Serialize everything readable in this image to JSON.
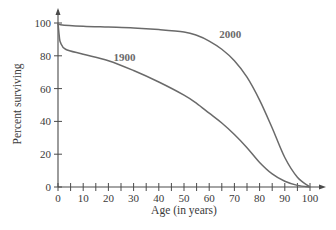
{
  "chart_data": {
    "type": "line",
    "title": "",
    "xlabel": "Age (in years)",
    "ylabel": "Percent surviving",
    "xlim": [
      0,
      100
    ],
    "ylim": [
      0,
      100
    ],
    "x_ticks": [
      0,
      10,
      20,
      30,
      40,
      50,
      60,
      70,
      80,
      90,
      100
    ],
    "x_minor_ticks_step": 5,
    "y_ticks": [
      0,
      20,
      40,
      60,
      80,
      100
    ],
    "grid": false,
    "legend": "inline labels on curves",
    "series": [
      {
        "name": "1900",
        "color": "#6a6a6a",
        "label_position": {
          "x": 22,
          "y": 77
        },
        "points": [
          [
            0,
            100
          ],
          [
            0.5,
            92
          ],
          [
            1,
            88
          ],
          [
            3,
            84
          ],
          [
            10,
            81
          ],
          [
            20,
            77
          ],
          [
            30,
            71
          ],
          [
            40,
            64
          ],
          [
            50,
            56
          ],
          [
            55,
            51
          ],
          [
            60,
            45
          ],
          [
            65,
            39
          ],
          [
            70,
            32
          ],
          [
            75,
            24
          ],
          [
            80,
            15
          ],
          [
            85,
            8
          ],
          [
            90,
            3.5
          ],
          [
            95,
            1
          ],
          [
            100,
            0
          ]
        ]
      },
      {
        "name": "2000",
        "color": "#6a6a6a",
        "label_position": {
          "x": 64,
          "y": 91
        },
        "points": [
          [
            0,
            100
          ],
          [
            1,
            99
          ],
          [
            10,
            98
          ],
          [
            20,
            97.5
          ],
          [
            30,
            97
          ],
          [
            40,
            96
          ],
          [
            50,
            94.5
          ],
          [
            55,
            92.5
          ],
          [
            60,
            89
          ],
          [
            65,
            84
          ],
          [
            70,
            77
          ],
          [
            75,
            67
          ],
          [
            80,
            53
          ],
          [
            85,
            36
          ],
          [
            90,
            18
          ],
          [
            95,
            6
          ],
          [
            100,
            0
          ]
        ]
      }
    ]
  }
}
